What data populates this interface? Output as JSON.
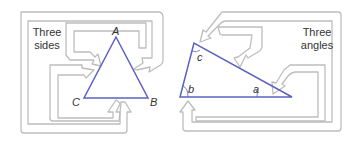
{
  "left_panel": {
    "caption_line1": "Three",
    "caption_line2": "sides",
    "vertices": {
      "A": "A",
      "B": "B",
      "C": "C"
    }
  },
  "right_panel": {
    "caption_line1": "Three",
    "caption_line2": "angles",
    "angles": {
      "a": "a",
      "b": "b",
      "c": "c"
    }
  },
  "colors": {
    "triangle": "#5a62c2",
    "arrow": "#bdbdbd",
    "text": "#333333"
  }
}
